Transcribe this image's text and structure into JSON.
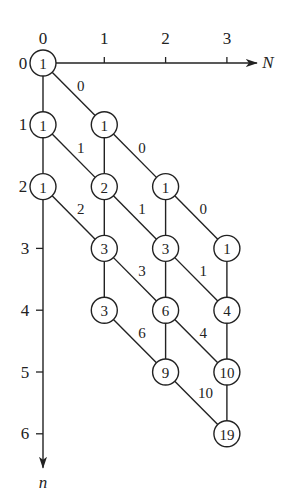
{
  "diagram": {
    "type": "lattice-graph",
    "geometry": {
      "origin_x": 43,
      "origin_y": 63,
      "col_spacing": 61.3,
      "row_spacing": 61.8,
      "node_radius": 13
    },
    "axes": {
      "horizontal": {
        "label": "N",
        "ticks": [
          "0",
          "1",
          "2",
          "3"
        ]
      },
      "vertical": {
        "label": "n",
        "ticks": [
          "0",
          "1",
          "2",
          "3",
          "4",
          "5",
          "6"
        ]
      }
    },
    "nodes": [
      {
        "col": 0,
        "row": 0,
        "value": "1"
      },
      {
        "col": 0,
        "row": 1,
        "value": "1"
      },
      {
        "col": 0,
        "row": 2,
        "value": "1"
      },
      {
        "col": 1,
        "row": 1,
        "value": "1"
      },
      {
        "col": 1,
        "row": 2,
        "value": "2"
      },
      {
        "col": 1,
        "row": 3,
        "value": "3"
      },
      {
        "col": 1,
        "row": 4,
        "value": "3"
      },
      {
        "col": 2,
        "row": 2,
        "value": "1"
      },
      {
        "col": 2,
        "row": 3,
        "value": "3"
      },
      {
        "col": 2,
        "row": 4,
        "value": "6"
      },
      {
        "col": 2,
        "row": 5,
        "value": "9"
      },
      {
        "col": 3,
        "row": 3,
        "value": "1"
      },
      {
        "col": 3,
        "row": 4,
        "value": "4"
      },
      {
        "col": 3,
        "row": 5,
        "value": "10"
      },
      {
        "col": 3,
        "row": 6,
        "value": "19"
      }
    ],
    "vertical_edges": [
      {
        "col": 0,
        "from_row": 0,
        "to_row": 1
      },
      {
        "col": 0,
        "from_row": 1,
        "to_row": 2
      },
      {
        "col": 1,
        "from_row": 1,
        "to_row": 2
      },
      {
        "col": 1,
        "from_row": 2,
        "to_row": 3
      },
      {
        "col": 1,
        "from_row": 3,
        "to_row": 4
      },
      {
        "col": 2,
        "from_row": 2,
        "to_row": 3
      },
      {
        "col": 2,
        "from_row": 3,
        "to_row": 4
      },
      {
        "col": 2,
        "from_row": 4,
        "to_row": 5
      },
      {
        "col": 3,
        "from_row": 3,
        "to_row": 4
      },
      {
        "col": 3,
        "from_row": 4,
        "to_row": 5
      },
      {
        "col": 3,
        "from_row": 5,
        "to_row": 6
      }
    ],
    "diagonal_edges": [
      {
        "from_col": 0,
        "from_row": 0,
        "label": "0"
      },
      {
        "from_col": 0,
        "from_row": 1,
        "label": "1"
      },
      {
        "from_col": 0,
        "from_row": 2,
        "label": "2"
      },
      {
        "from_col": 1,
        "from_row": 1,
        "label": "0"
      },
      {
        "from_col": 1,
        "from_row": 2,
        "label": "1"
      },
      {
        "from_col": 1,
        "from_row": 3,
        "label": "3"
      },
      {
        "from_col": 1,
        "from_row": 4,
        "label": "6"
      },
      {
        "from_col": 2,
        "from_row": 2,
        "label": "0"
      },
      {
        "from_col": 2,
        "from_row": 3,
        "label": "1"
      },
      {
        "from_col": 2,
        "from_row": 4,
        "label": "4"
      },
      {
        "from_col": 2,
        "from_row": 5,
        "label": "10"
      }
    ]
  }
}
